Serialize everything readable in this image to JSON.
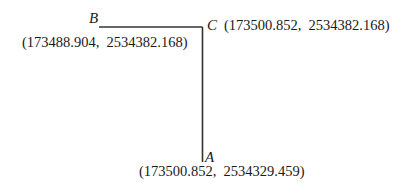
{
  "diagram": {
    "points": {
      "A": {
        "label": "A",
        "coords": "(173500.852,  2534329.459)"
      },
      "B": {
        "label": "B",
        "coords": "(173488.904,  2534382.168)"
      },
      "C": {
        "label": "C",
        "coords": "(173500.852,  2534382.168)"
      }
    },
    "segments": [
      {
        "from": "B",
        "to": "C"
      },
      {
        "from": "C",
        "to": "A"
      }
    ],
    "line_color": "#333333"
  }
}
